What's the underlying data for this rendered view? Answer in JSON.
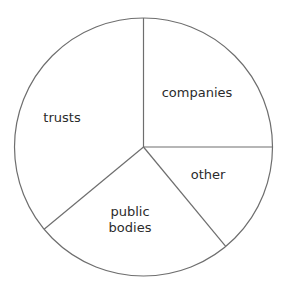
{
  "chart_data": {
    "type": "pie",
    "title": "",
    "start_angle_deg": 90,
    "direction": "clockwise",
    "categories": [
      "companies",
      "other",
      "public bodies",
      "trusts"
    ],
    "values": [
      25,
      14,
      25,
      36
    ],
    "unit": "%",
    "legend": "none (labels placed inside slices)",
    "colors": {
      "fill": "#ffffff",
      "stroke": "#6e6e6e",
      "label": "#2b2b2b"
    }
  },
  "labels": {
    "companies": "companies",
    "other": "other",
    "public_line1": "public",
    "public_line2": "bodies",
    "trusts": "trusts"
  }
}
